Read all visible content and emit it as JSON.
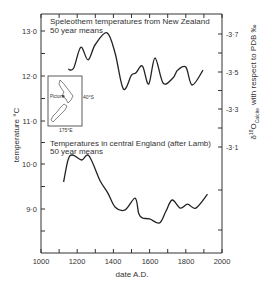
{
  "chart_data": [
    {
      "type": "line",
      "title": "Speleothem temperatures from New Zealand",
      "subtitle": "50 year means",
      "xlabel": "date A.D.",
      "ylabel_left": "temperature °C",
      "ylabel_right": "δ18O Calcite with respect to PDB ‰",
      "x_ticks": [
        1000,
        1200,
        1400,
        1600,
        1800,
        2000
      ],
      "xlim": [
        1000,
        2000
      ],
      "y_ticks_left": [
        11.0,
        12.0,
        13.0
      ],
      "y_ticks_right": [
        -3.7,
        -3.5,
        -3.3,
        -3.1
      ],
      "series": [
        {
          "name": "NZ speleothem temperature (50 yr means)",
          "x": [
            1150,
            1180,
            1220,
            1260,
            1300,
            1365,
            1410,
            1455,
            1500,
            1525,
            1560,
            1595,
            1630,
            1675,
            1730,
            1755,
            1800,
            1835,
            1895
          ],
          "values": [
            12.15,
            12.17,
            12.64,
            12.36,
            12.7,
            12.96,
            12.5,
            11.71,
            12.02,
            12.07,
            12.22,
            11.82,
            12.4,
            11.84,
            11.96,
            12.13,
            12.2,
            11.8,
            12.13
          ]
        }
      ],
      "inset_map": {
        "region": "New Zealand",
        "labels": [
          "Pictone",
          "40°S",
          "175°E"
        ]
      },
      "grid": false
    },
    {
      "type": "line",
      "title": "Temperatures in central England (after Lamb)",
      "subtitle": "50 year means",
      "xlabel": "date A.D.",
      "ylabel": "temperature °C",
      "x_ticks": [
        1000,
        1200,
        1400,
        1600,
        1800,
        2000
      ],
      "xlim": [
        1000,
        2000
      ],
      "y_ticks": [
        9.0,
        10.0
      ],
      "series": [
        {
          "name": "Central England temperature (50 yr means)",
          "x": [
            1125,
            1150,
            1175,
            1225,
            1265,
            1325,
            1370,
            1410,
            1465,
            1520,
            1540,
            1560,
            1600,
            1655,
            1690,
            1725,
            1770,
            1810,
            1855,
            1920
          ],
          "values": [
            9.6,
            10.1,
            10.2,
            10.09,
            10.18,
            9.64,
            9.35,
            9.04,
            8.98,
            9.24,
            8.9,
            8.8,
            8.78,
            8.69,
            8.95,
            9.2,
            9.02,
            9.11,
            9.02,
            9.33
          ]
        }
      ],
      "grid": false
    }
  ],
  "labels": {
    "upper_title": "Speleothem temperatures from New Zealand",
    "upper_subtitle": "50 year means",
    "lower_title": "Temperatures in central England (after Lamb)",
    "lower_subtitle": "50 year means",
    "xlabel": "date A.D.",
    "ylabel_left": "temperature °C",
    "ylabel_right_prefix": "δ",
    "ylabel_right_sup": "18",
    "ylabel_right_O": "O",
    "ylabel_right_sub": "Calcite",
    "ylabel_right_rest": "with respect to PDB ‰",
    "map_site": "Pictone",
    "map_lat": "40°S",
    "map_lon": "175°E"
  },
  "axes": {
    "x_ticks": [
      "1000",
      "1200",
      "1400",
      "1600",
      "1800",
      "2000"
    ],
    "left_ticks": [
      "13·0",
      "12·0",
      "11·0",
      "10·0",
      "9·0"
    ],
    "right_ticks": [
      "-3·7",
      "-3·5",
      "-3·3",
      "-3·1"
    ]
  }
}
